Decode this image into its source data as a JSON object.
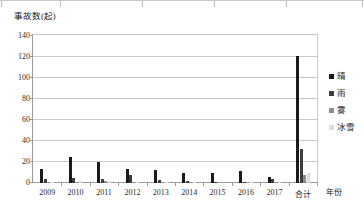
{
  "chart_data": {
    "type": "bar",
    "title": "",
    "ylabel": "事故数(起)",
    "xlabel": "年份",
    "categories": [
      "2009",
      "2010",
      "2011",
      "2012",
      "2013",
      "2014",
      "2015",
      "2016",
      "2017",
      "合计"
    ],
    "series": [
      {
        "name": "晴",
        "color": "#1a1a1a",
        "values": [
          13,
          25,
          20,
          13,
          12,
          10,
          10,
          11,
          6,
          121
        ]
      },
      {
        "name": "雨",
        "color": "#3d3d3d",
        "values": [
          4,
          5,
          4,
          8,
          3,
          2,
          1,
          1,
          4,
          32
        ]
      },
      {
        "name": "雾",
        "color": "#8c8c8c",
        "values": [
          1,
          1,
          2,
          1,
          0,
          1,
          0,
          0,
          1,
          8
        ]
      },
      {
        "name": "冰雪",
        "color": "#dcdcdc",
        "values": [
          1,
          2,
          2,
          1,
          1,
          1,
          0,
          1,
          1,
          10
        ]
      }
    ],
    "ylim": [
      0,
      140
    ],
    "yticks": [
      0,
      20,
      40,
      60,
      80,
      100,
      120,
      140
    ],
    "grid": true,
    "legend_position": "right"
  },
  "axes": {
    "y_title": "事故数(起)",
    "x_title": "年份"
  },
  "colors": {
    "gridline": "#c9c9c9",
    "axis": "#9a9a9a",
    "text": "#2b2b2b",
    "background": "#ffffff"
  }
}
